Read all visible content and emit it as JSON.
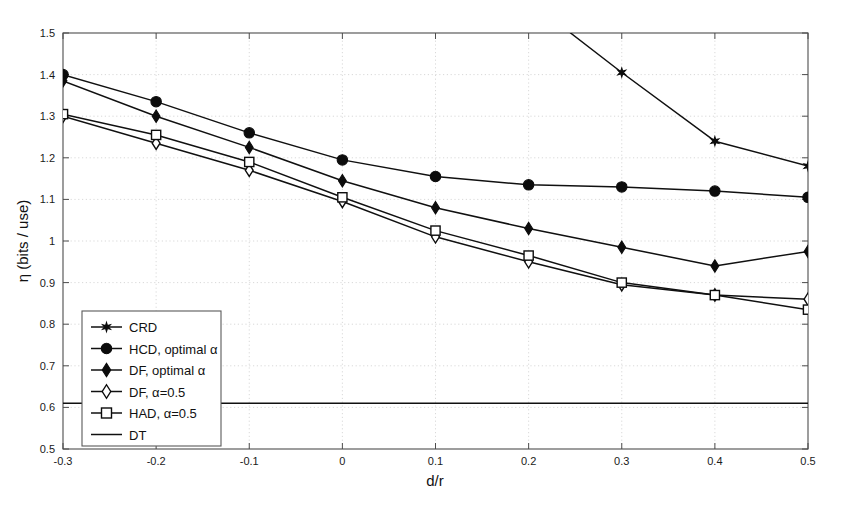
{
  "figure": {
    "background_color": "#ffffff",
    "line_color": "#101010",
    "frame_color": "#4d4d4d",
    "grid_color": "#c9c9c9"
  },
  "axes": {
    "xlabel": "d/r",
    "ylabel": "η (bits / use)",
    "x_ticks": [
      "-0.3",
      "-0.2",
      "-0.1",
      "0",
      "0.1",
      "0.2",
      "0.3",
      "0.4",
      "0.5"
    ],
    "y_ticks": [
      "0.5",
      "0.6",
      "0.7",
      "0.8",
      "0.9",
      "1",
      "1.1",
      "1.2",
      "1.3",
      "1.4",
      "1.5"
    ]
  },
  "legend": {
    "position": "lower-left",
    "entries": [
      {
        "label": "CRD",
        "marker": "star-icon"
      },
      {
        "label": "HCD, optimal α",
        "marker": "filled-circle-icon"
      },
      {
        "label": "DF, optimal α",
        "marker": "filled-diamond-icon"
      },
      {
        "label": "DF, α=0.5",
        "marker": "open-diamond-icon"
      },
      {
        "label": "HAD, α=0.5",
        "marker": "open-square-icon"
      },
      {
        "label": "DT",
        "marker": "plain-line-icon"
      }
    ]
  },
  "chart_data": {
    "type": "line",
    "title": "",
    "xlabel": "d/r",
    "ylabel": "η (bits / use)",
    "xlim": [
      -0.3,
      0.5
    ],
    "ylim": [
      0.5,
      1.5
    ],
    "xticks": [
      -0.3,
      -0.2,
      -0.1,
      0,
      0.1,
      0.2,
      0.3,
      0.4,
      0.5
    ],
    "yticks": [
      0.5,
      0.6,
      0.7,
      0.8,
      0.9,
      1.0,
      1.1,
      1.2,
      1.3,
      1.4,
      1.5
    ],
    "grid": true,
    "legend_position": "lower left",
    "x": [
      -0.3,
      -0.2,
      -0.1,
      0,
      0.1,
      0.2,
      0.3,
      0.4,
      0.5
    ],
    "series": [
      {
        "name": "CRD",
        "marker": "star",
        "filled": true,
        "x": [
          0.245,
          0.3,
          0.4,
          0.5
        ],
        "values": [
          1.5,
          1.405,
          1.24,
          1.18
        ],
        "note": "curve enters top of axes near d/r = 0.245; clipped above 1.5"
      },
      {
        "name": "HCD, optimal α",
        "marker": "circle",
        "filled": true,
        "values": [
          1.4,
          1.335,
          1.26,
          1.195,
          1.155,
          1.135,
          1.13,
          1.12,
          1.105
        ]
      },
      {
        "name": "DF, optimal α",
        "marker": "diamond",
        "filled": true,
        "values": [
          1.385,
          1.3,
          1.225,
          1.145,
          1.08,
          1.03,
          0.985,
          0.94,
          0.975
        ]
      },
      {
        "name": "DF, α=0.5",
        "marker": "diamond",
        "filled": false,
        "values": [
          1.3,
          1.235,
          1.17,
          1.095,
          1.01,
          0.95,
          0.895,
          0.87,
          0.86
        ]
      },
      {
        "name": "HAD, α=0.5",
        "marker": "square",
        "filled": false,
        "values": [
          1.305,
          1.255,
          1.19,
          1.105,
          1.025,
          0.965,
          0.9,
          0.87,
          0.835
        ]
      },
      {
        "name": "DT",
        "marker": "none",
        "filled": false,
        "constant": 0.61,
        "values": [
          0.61,
          0.61,
          0.61,
          0.61,
          0.61,
          0.61,
          0.61,
          0.61,
          0.61
        ]
      }
    ]
  }
}
